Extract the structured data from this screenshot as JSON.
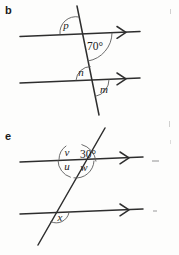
{
  "page": {
    "background_color": "#fdfdfc",
    "ink_color": "#2e2e2e",
    "arc_color": "#5a5a5a",
    "width": 179,
    "height": 255
  },
  "figures": [
    {
      "id": "figure-b",
      "label": "b",
      "description": "Two parallel lines cut by a transversal; angles p and 70 degrees at the upper intersection, n and m at the lower intersection.",
      "parallel_lines": 2,
      "transversal_count": 1,
      "arrow_marks": 2,
      "angles": [
        {
          "name": "angle-p",
          "label": "p",
          "position": "upper-intersection-above-left",
          "style": "italic"
        },
        {
          "name": "angle-70",
          "label": "70°",
          "position": "upper-intersection-below-right",
          "style": "numeric"
        },
        {
          "name": "angle-n",
          "label": "n",
          "position": "lower-intersection-above-left",
          "style": "italic"
        },
        {
          "name": "angle-m",
          "label": "m",
          "position": "lower-intersection-below-right",
          "style": "italic"
        }
      ]
    },
    {
      "id": "figure-e",
      "label": "e",
      "description": "Two parallel lines cut by a transversal sloping up to the right; angles v, 30 degrees, u and w around the upper intersection, angle x at the lower intersection.",
      "parallel_lines": 2,
      "transversal_count": 1,
      "arrow_marks": 2,
      "angles": [
        {
          "name": "angle-v",
          "label": "v",
          "position": "upper-intersection-above-left",
          "style": "italic"
        },
        {
          "name": "angle-30",
          "label": "30°",
          "position": "upper-intersection-above-right",
          "style": "numeric"
        },
        {
          "name": "angle-u",
          "label": "u",
          "position": "upper-intersection-below-left",
          "style": "italic"
        },
        {
          "name": "angle-w",
          "label": "w",
          "position": "upper-intersection-below-right",
          "style": "italic"
        },
        {
          "name": "angle-x",
          "label": "x",
          "position": "lower-intersection-below-right",
          "style": "italic"
        }
      ]
    }
  ]
}
